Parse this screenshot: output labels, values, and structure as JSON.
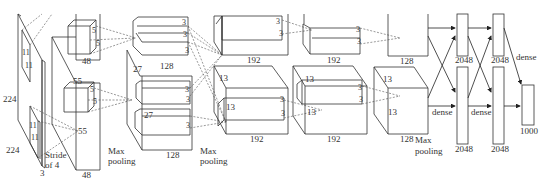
{
  "diagram": {
    "title": "",
    "labels": {
      "input_h": "224",
      "input_w": "224",
      "input_d": "3",
      "k1a": "11",
      "k1b": "11",
      "k1c": "11",
      "k1d": "11",
      "stride": "Stride",
      "stride2": "of 4",
      "c1_dim": "55",
      "c1_dim2": "55",
      "c1_depth_top": "48",
      "c1_depth_bot": "48",
      "k2a": "5",
      "k2b": "5",
      "k2c": "5",
      "k2d": "5",
      "maxpool1a": "Max",
      "maxpool1b": "pooling",
      "c2_dim": "27",
      "c2_dim2": "27",
      "c2_depth_top": "128",
      "c2_depth_bot": "128",
      "k3a": "3",
      "k3b": "3",
      "k3c": "3",
      "k3d": "3",
      "k3e": "3",
      "k3f": "3",
      "maxpool2a": "Max",
      "maxpool2b": "pooling",
      "c3_dim": "13",
      "c3_dim2": "13",
      "c3_depth_top": "192",
      "c3_depth_bot": "192",
      "k4a": "3",
      "k4b": "3",
      "k4c": "3",
      "k4d": "3",
      "c4_dim": "13",
      "c4_dim2": "13",
      "c4_depth_top": "192",
      "c4_depth_bot": "192",
      "k5a": "3",
      "k5b": "3",
      "k5c": "3",
      "k5d": "3",
      "c5_dim": "13",
      "c5_dim2": "13",
      "c5_depth_top": "128",
      "c5_depth_bot": "128",
      "maxpool3a": "Max",
      "maxpool3b": "pooling",
      "fc6_top": "2048",
      "fc6_bot": "2048",
      "fc7_top": "2048",
      "fc7_bot": "2048",
      "dense1": "dense",
      "dense2": "dense",
      "dense3": "dense",
      "out": "1000"
    }
  }
}
